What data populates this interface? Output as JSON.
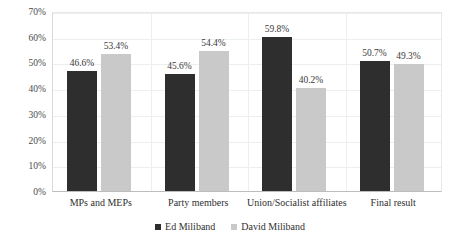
{
  "chart_data": {
    "type": "bar",
    "title": "",
    "subtitle": "",
    "xlabel": "",
    "ylabel": "",
    "ylim": [
      0,
      70
    ],
    "ytick_labels": [
      "0%",
      "10%",
      "20%",
      "30%",
      "40%",
      "50%",
      "60%",
      "70%"
    ],
    "ytick_values": [
      0,
      10,
      20,
      30,
      40,
      50,
      60,
      70
    ],
    "grid": true,
    "legend_position": "bottom",
    "categories": [
      "MPs and MEPs",
      "Party members",
      "Union/Socialist affiliates",
      "Final result"
    ],
    "series": [
      {
        "name": "Ed Miliband",
        "color": "#2e2e2e",
        "values": [
          46.6,
          45.6,
          59.8,
          50.7
        ],
        "data_labels": [
          "46.6%",
          "45.6%",
          "59.8%",
          "50.7%"
        ]
      },
      {
        "name": "David Miliband",
        "color": "#c9c9c9",
        "values": [
          53.4,
          54.4,
          40.2,
          49.3
        ],
        "data_labels": [
          "53.4%",
          "54.4%",
          "40.2%",
          "49.3%"
        ]
      }
    ]
  },
  "legend": {
    "items": [
      {
        "label": "Ed Miliband",
        "color": "#2e2e2e",
        "marker": "square-swatch-dark"
      },
      {
        "label": "David Miliband",
        "color": "#c9c9c9",
        "marker": "square-swatch-light"
      }
    ]
  }
}
